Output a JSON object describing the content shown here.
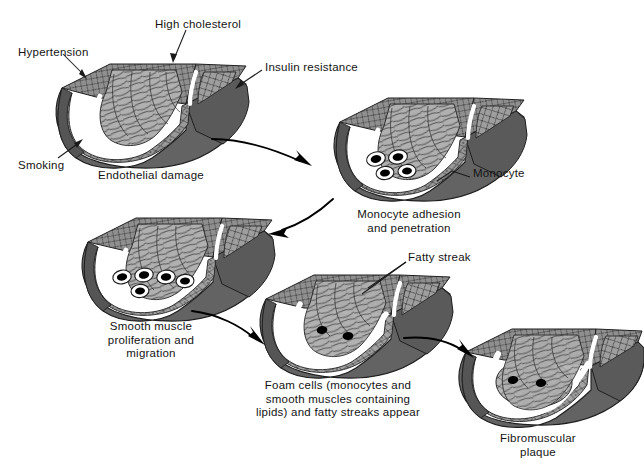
{
  "figure": {
    "background_color": "#ffffff",
    "text_color": "#141414",
    "width": 644,
    "height": 461
  },
  "palette": {
    "outer_wall_dark": "#5f5f5f",
    "outer_wall_mid": "#6e6e6e",
    "adventitia_shadow": "#4a4a4a",
    "media_fill": "#9a9a9a",
    "media_light": "#b4b4b4",
    "intima_fill": "#8d8d8d",
    "lumen_fill": "#a8a8a8",
    "lumen_light": "#bdbdbd",
    "endothelium_white": "#ffffff",
    "cell_outline": "#2b2b2b",
    "monocyte_core": "#000000",
    "arrow_color": "#000000",
    "leader_color": "#1a1a1a"
  },
  "risk_factor_labels": [
    {
      "id": "hypertension",
      "text": "Hypertension",
      "x": 18,
      "y": 46,
      "align": "left"
    },
    {
      "id": "high-cholesterol",
      "text": "High cholesterol",
      "x": 155,
      "y": 18,
      "align": "left"
    },
    {
      "id": "insulin-resistance",
      "text": "Insulin resistance",
      "x": 265,
      "y": 61,
      "align": "left"
    },
    {
      "id": "smoking",
      "text": "Smoking",
      "x": 18,
      "y": 159,
      "align": "left"
    }
  ],
  "stages": [
    {
      "id": "stage-1",
      "order": 1,
      "caption": "Endothelial damage",
      "caption_x": 151,
      "caption_y": 169,
      "caption_align": "center",
      "monocyte_count": 0,
      "has_fatty_streak": false,
      "has_plaque": false
    },
    {
      "id": "stage-2",
      "order": 2,
      "caption": "Monocyte adhesion\nand penetration",
      "caption_x": 409,
      "caption_y": 208,
      "caption_align": "center",
      "monocyte_count": 4,
      "has_fatty_streak": false,
      "has_plaque": false
    },
    {
      "id": "stage-3",
      "order": 3,
      "caption": "Smooth muscle\nproliferation and\nmigration",
      "caption_x": 151,
      "caption_y": 320,
      "caption_align": "center",
      "monocyte_count": 5,
      "has_fatty_streak": false,
      "has_plaque": false
    },
    {
      "id": "stage-4",
      "order": 4,
      "caption": "Foam cells (monocytes and\nsmooth muscles containing\nlipids) and fatty streaks appear",
      "caption_x": 338,
      "caption_y": 379,
      "caption_align": "center",
      "monocyte_count": 2,
      "has_fatty_streak": true,
      "has_plaque": false
    },
    {
      "id": "stage-5",
      "order": 5,
      "caption": "Fibromuscular plaque",
      "caption_x": 538,
      "caption_y": 432,
      "caption_align": "center",
      "monocyte_count": 2,
      "has_fatty_streak": true,
      "has_plaque": true
    }
  ],
  "callouts": [
    {
      "id": "monocyte",
      "text": "Monocyte",
      "x": 473,
      "y": 173,
      "align": "left"
    },
    {
      "id": "fatty-streak",
      "text": "Fatty streak",
      "x": 408,
      "y": 257,
      "align": "left"
    }
  ],
  "flow_arrows": [
    {
      "id": "arrow-1-to-2",
      "from_stage": "stage-1",
      "to_stage": "stage-2",
      "direction": "right-down"
    },
    {
      "id": "arrow-2-to-3",
      "from_stage": "stage-2",
      "to_stage": "stage-3",
      "direction": "left-down"
    },
    {
      "id": "arrow-3-to-4",
      "from_stage": "stage-3",
      "to_stage": "stage-4",
      "direction": "right-down"
    },
    {
      "id": "arrow-4-to-5",
      "from_stage": "stage-4",
      "to_stage": "stage-5",
      "direction": "right-down"
    }
  ]
}
